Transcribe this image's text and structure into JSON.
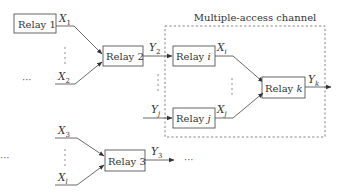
{
  "diagram": {
    "title": "Multiple-access channel",
    "relays": {
      "relay1": {
        "label": "Relay",
        "index": "1"
      },
      "relay2": {
        "label": "Relay",
        "index": "2"
      },
      "relay3": {
        "label": "Relay",
        "index": "3"
      },
      "relayI": {
        "label": "Relay",
        "index": "i"
      },
      "relayJ": {
        "label": "Relay",
        "index": "j"
      },
      "relayK": {
        "label": "Relay",
        "index": "k"
      }
    },
    "signals": {
      "x1": {
        "base": "X",
        "sub": "1"
      },
      "x2": {
        "base": "X",
        "sub": "2"
      },
      "x3": {
        "base": "X",
        "sub": "3"
      },
      "xl": {
        "base": "X",
        "sub": "l"
      },
      "y2": {
        "base": "Y",
        "sub": "2"
      },
      "y3": {
        "base": "Y",
        "sub": "3"
      },
      "yj": {
        "base": "Y",
        "sub": "j"
      },
      "yk": {
        "base": "Y",
        "sub": "k"
      },
      "xi": {
        "base": "X",
        "sub": "i"
      },
      "xj": {
        "base": "X",
        "sub": "j"
      }
    },
    "ellipsis": "···"
  }
}
